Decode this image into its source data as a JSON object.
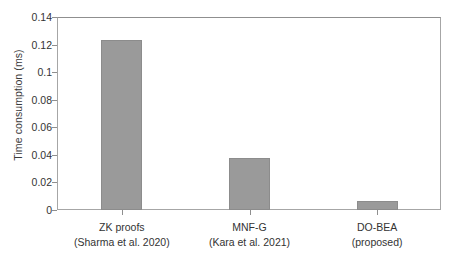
{
  "chart_data": {
    "type": "bar",
    "title": "",
    "xlabel": "",
    "ylabel": "Time consumption (ms)",
    "categories": [
      "ZK proofs\n(Sharma et al. 2020)",
      "MNF-G\n(Kara et al. 2021)",
      "DO-BEA\n(proposed)"
    ],
    "category_lines": [
      {
        "line1": "ZK proofs",
        "line2": "(Sharma et al. 2020)"
      },
      {
        "line1": "MNF-G",
        "line2": "(Kara et al. 2021)"
      },
      {
        "line1": "DO-BEA",
        "line2": "(proposed)"
      }
    ],
    "values": [
      0.1235,
      0.038,
      0.0065
    ],
    "ylim": [
      0,
      0.14
    ],
    "xlim": [
      0,
      3
    ],
    "yticks": [
      0,
      0.02,
      0.04,
      0.06,
      0.08,
      0.1,
      0.12,
      0.14
    ],
    "ytick_labels": [
      "0",
      "0.02",
      "0.04",
      "0.06",
      "0.08",
      "0.1",
      "0.12",
      "0.14"
    ],
    "grid": false,
    "legend": false,
    "legend_position": "none",
    "bar_color": "#9a9a9a",
    "bar_edge_color": "#8c8c8c",
    "axis_color": "#8f8f8f",
    "text_color": "#333333",
    "background": "#ffffff"
  }
}
